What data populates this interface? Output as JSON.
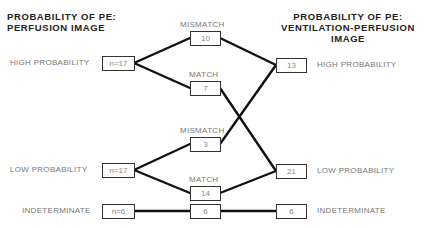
{
  "titles": {
    "left": [
      "PROBABILITY OF PE:",
      "PERFUSION IMAGE"
    ],
    "right": [
      "PROBABILITY OF PE:",
      "VENTILATION-PERFUSION",
      "IMAGE"
    ]
  },
  "left_nodes": [
    {
      "label": "HIGH PROBABILITY",
      "value": "n=17"
    },
    {
      "label": "LOW PROBABILITY",
      "value": "n=17"
    },
    {
      "label": "INDETERMINATE",
      "value": "n=6"
    }
  ],
  "middle_nodes": [
    {
      "label": "MISMATCH",
      "value": "10"
    },
    {
      "label": "MATCH",
      "value": "7"
    },
    {
      "label": "MISMATCH",
      "value": "3"
    },
    {
      "label": "MATCH",
      "value": "14"
    },
    {
      "label": "",
      "value": "6"
    }
  ],
  "right_nodes": [
    {
      "label": "HIGH PROBABILITY",
      "value": "13"
    },
    {
      "label": "LOW PROBABILITY",
      "value": "21"
    },
    {
      "label": "INDETERMINATE",
      "value": "6"
    }
  ],
  "colors": {
    "line": "#111111",
    "box_border": "#333333",
    "text": "#777777",
    "title": "#222222"
  }
}
